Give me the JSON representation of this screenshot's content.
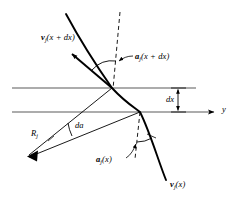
{
  "figure": {
    "background_color": "#ffffff",
    "line_color": "#000000",
    "grid_line_color": "#555555",
    "labels": {
      "velocity_upper": "v",
      "velocity_upper_sub": "j",
      "velocity_upper_arg": "(x + dx)",
      "velocity_lower": "v",
      "velocity_lower_sub": "j",
      "velocity_lower_arg": "(x)",
      "angle_upper": "a",
      "angle_upper_sub": "j",
      "angle_upper_arg": "(x + dx)",
      "angle_lower": "a",
      "angle_lower_sub": "j",
      "angle_lower_arg": "(x)",
      "radius": "R",
      "radius_sub": "j",
      "delta_angle": "da",
      "thickness": "dx",
      "axis_y": "y"
    }
  },
  "geometry": {
    "upper_horizontal_line": {
      "x1": 12,
      "y1": 88,
      "x2": 196,
      "y2": 88
    },
    "lower_horizontal_line": {
      "x1": 12,
      "y1": 112,
      "x2": 218,
      "y2": 112
    },
    "y_axis_arrow_tip_x": 218,
    "dx_marker_x": 178,
    "curve_points": "M 66,14 L 88,56 L 112,88 L 140,112 L 166,180",
    "upper_intersection": {
      "x": 112,
      "y": 88
    },
    "lower_intersection": {
      "x": 140,
      "y": 112
    },
    "radius_vertex": {
      "x": 27,
      "y": 157
    },
    "dashed_vertical_upper": {
      "x": 120,
      "y1": 12,
      "y2": 88
    },
    "dashed_vertical_lower": {
      "x": 140,
      "y1": 112,
      "y2": 158
    },
    "velocity_upper_arrow": {
      "x1": 112,
      "y1": 88,
      "x2": 69,
      "y2": 51
    },
    "velocity_lower_arrow": {
      "x1": 140,
      "y1": 112,
      "x2": 166,
      "y2": 180
    }
  }
}
